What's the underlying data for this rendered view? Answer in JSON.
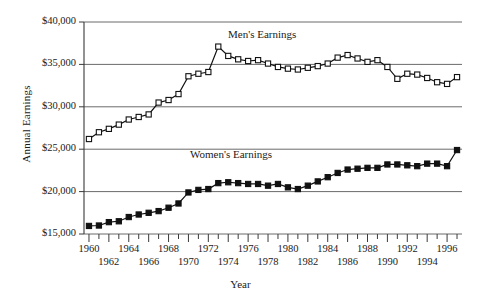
{
  "chart_data": {
    "type": "line",
    "title": "",
    "xlabel": "Year",
    "ylabel": "Annual Earnings",
    "xlim": [
      1959.5,
      1997.5
    ],
    "ylim": [
      15000,
      40000
    ],
    "grid": true,
    "legend_position": "inline-annotation",
    "ytick_labels": [
      "$40,000",
      "$35,000",
      "$30,000",
      "$25,000",
      "$20,000",
      "$15,000"
    ],
    "ytick_values": [
      40000,
      35000,
      30000,
      25000,
      20000,
      15000
    ],
    "xtick_labels": [
      "1960",
      "1962",
      "1964",
      "1966",
      "1968",
      "1970",
      "1972",
      "1974",
      "1976",
      "1978",
      "1980",
      "1982",
      "1984",
      "1986",
      "1988",
      "1990",
      "1992",
      "1994",
      "1996"
    ],
    "xtick_values": [
      1960,
      1962,
      1964,
      1966,
      1968,
      1970,
      1972,
      1974,
      1976,
      1978,
      1980,
      1982,
      1984,
      1986,
      1988,
      1990,
      1992,
      1994,
      1996
    ],
    "x": [
      1960,
      1961,
      1962,
      1963,
      1964,
      1965,
      1966,
      1967,
      1968,
      1969,
      1970,
      1971,
      1972,
      1973,
      1974,
      1975,
      1976,
      1977,
      1978,
      1979,
      1980,
      1981,
      1982,
      1983,
      1984,
      1985,
      1986,
      1987,
      1988,
      1989,
      1990,
      1991,
      1992,
      1993,
      1994,
      1995,
      1996,
      1997
    ],
    "series": [
      {
        "name": "Men's Earnings",
        "marker": "open-square",
        "color": "#111111",
        "values": [
          26200,
          27000,
          27400,
          27900,
          28500,
          28800,
          29100,
          30500,
          30800,
          31500,
          33600,
          33900,
          34100,
          37100,
          36000,
          35600,
          35400,
          35500,
          35100,
          34700,
          34500,
          34400,
          34600,
          34800,
          35100,
          35800,
          36100,
          35700,
          35300,
          35500,
          34700,
          33300,
          33900,
          33800,
          33400,
          32900,
          32700,
          33500
        ]
      },
      {
        "name": "Women's Earnings",
        "marker": "filled-square",
        "color": "#111111",
        "values": [
          15950,
          16000,
          16400,
          16500,
          17000,
          17300,
          17500,
          17700,
          18100,
          18600,
          19900,
          20200,
          20300,
          21000,
          21100,
          21000,
          20900,
          20900,
          20700,
          20900,
          20500,
          20300,
          20700,
          21200,
          21700,
          22200,
          22600,
          22700,
          22800,
          22800,
          23200,
          23200,
          23100,
          23000,
          23300,
          23300,
          23000,
          24900
        ]
      }
    ],
    "annotations": [
      {
        "text": "Men's Earnings",
        "x": 1977,
        "y": 38200
      },
      {
        "text": "Women's Earnings",
        "x": 1973,
        "y": 24200
      }
    ]
  },
  "axis": {
    "y_title": "Annual Earnings",
    "x_title": "Year"
  }
}
